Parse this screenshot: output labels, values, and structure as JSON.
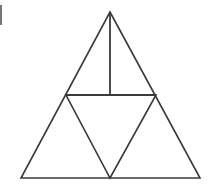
{
  "figure": {
    "background_color": "#ffffff",
    "stroke_color": "#3a3a3a",
    "stroke_width": 1.6,
    "width": 212,
    "height": 186,
    "caption": "",
    "partial_label_at_left_edge": ")",
    "vertices": {
      "apex": [
        110,
        12
      ],
      "bottom_left": [
        21,
        178
      ],
      "bottom_right": [
        200,
        178
      ],
      "left_midpoint": [
        66,
        95
      ],
      "right_midpoint": [
        156,
        95
      ],
      "base_midpoint": [
        110,
        178
      ],
      "altitude_foot": [
        110,
        95
      ]
    },
    "shapes": [
      {
        "name": "outer-triangle",
        "type": "polygon",
        "points": "110,12 200,178 21,178"
      },
      {
        "name": "inverted-inner-triangle",
        "type": "polygon",
        "points": "66,95 156,95 110,178"
      },
      {
        "name": "horizontal-midsegment",
        "type": "line",
        "x1": 66,
        "y1": 95,
        "x2": 156,
        "y2": 95
      },
      {
        "name": "vertical-altitude",
        "type": "line",
        "x1": 110,
        "y1": 12,
        "x2": 110,
        "y2": 95
      }
    ]
  }
}
